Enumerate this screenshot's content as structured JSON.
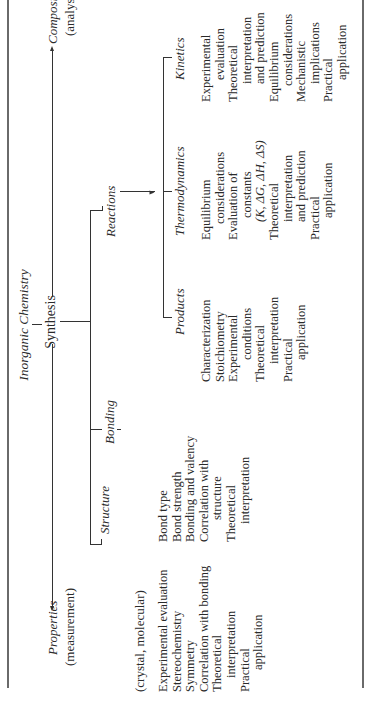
{
  "title": "Inorganic Chemistry",
  "root": {
    "label": "Inorganic Chemistry",
    "center": "Synthesis"
  },
  "left_branch": {
    "label": "Properties",
    "sub": "(measurement)"
  },
  "right_branch": {
    "label": "Composition",
    "sub": "(analysis)"
  },
  "synthesis_children": {
    "structure": {
      "label": "Structure",
      "sub": "(crystal, molecular)",
      "items": [
        [
          "Experimental evaluation"
        ],
        [
          "Stereochemistry"
        ],
        [
          "Symmetry"
        ],
        [
          "Correlation with bonding"
        ],
        [
          "Theoretical",
          "interpretation"
        ],
        [
          "Practical",
          "application"
        ]
      ]
    },
    "bonding": {
      "label": "Bonding",
      "items": [
        [
          "Bond type"
        ],
        [
          "Bond strength"
        ],
        [
          "Bonding and valency"
        ],
        [
          "Correlation with",
          "structure"
        ],
        [
          "Theoretical",
          "interpretation"
        ]
      ]
    },
    "reactions": {
      "label": "Reactions",
      "children": {
        "products": {
          "label": "Products",
          "items": [
            [
              "Characterization"
            ],
            [
              "Stoichiometry"
            ],
            [
              "Experimental",
              "conditions"
            ],
            [
              "Theoretical",
              "interpretation"
            ],
            [
              "Practical",
              "application"
            ]
          ]
        },
        "thermodynamics": {
          "label": "Thermodynamics",
          "items": [
            [
              "Equilibrium",
              "considerations"
            ],
            [
              "Evaluation of",
              "constants",
              "(K, ΔG, ΔH, ΔS)"
            ],
            [
              "Theoretical",
              "interpretation",
              "and prediction"
            ],
            [
              "Practical",
              "application"
            ]
          ]
        },
        "kinetics": {
          "label": "Kinetics",
          "items": [
            [
              "Experimental",
              "evaluation"
            ],
            [
              "Theoretical",
              "interpretation",
              "and prediction"
            ],
            [
              "Equilibrium",
              "considerations"
            ],
            [
              "Mechanistic",
              "implications"
            ],
            [
              "Practical",
              "application"
            ]
          ]
        }
      }
    }
  },
  "colors": {
    "ink": "#2a2a2a",
    "rule": "#6a6a6a",
    "background": "#ffffff"
  }
}
